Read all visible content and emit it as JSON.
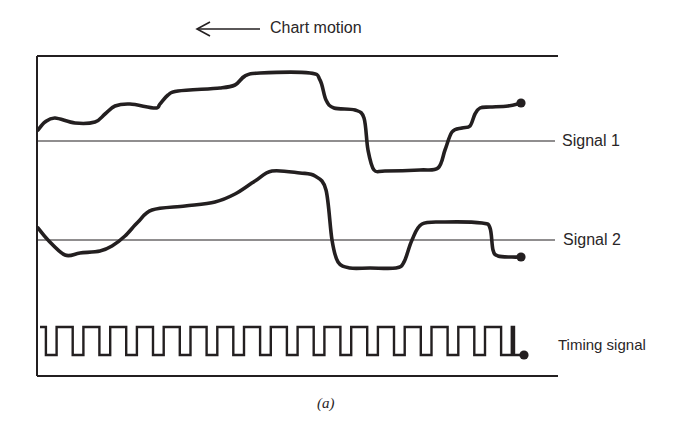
{
  "header": {
    "motion_label": "Chart motion",
    "motion_direction": "left"
  },
  "labels": {
    "signal1": "Signal 1",
    "signal2": "Signal 2",
    "timing": "Timing signal"
  },
  "caption": "(a)",
  "colors": {
    "ink": "#231f20",
    "background": "#ffffff"
  },
  "chart_data": {
    "type": "line",
    "annotation": "Chart motion (arrow pointing left)",
    "xlabel": "",
    "ylabel": "",
    "grid": false,
    "series": [
      {
        "name": "Signal 1",
        "baseline_y_px": 141,
        "points_px": [
          [
            38,
            130
          ],
          [
            45,
            122
          ],
          [
            55,
            118
          ],
          [
            75,
            123
          ],
          [
            95,
            122
          ],
          [
            105,
            114
          ],
          [
            115,
            106
          ],
          [
            130,
            104
          ],
          [
            155,
            108
          ],
          [
            160,
            104
          ],
          [
            168,
            95
          ],
          [
            178,
            91
          ],
          [
            220,
            88
          ],
          [
            235,
            85
          ],
          [
            245,
            76
          ],
          [
            260,
            73
          ],
          [
            310,
            73
          ],
          [
            320,
            80
          ],
          [
            326,
            100
          ],
          [
            334,
            108
          ],
          [
            355,
            110
          ],
          [
            364,
            118
          ],
          [
            368,
            150
          ],
          [
            374,
            170
          ],
          [
            385,
            171
          ],
          [
            420,
            170
          ],
          [
            438,
            168
          ],
          [
            445,
            150
          ],
          [
            452,
            132
          ],
          [
            462,
            128
          ],
          [
            470,
            126
          ],
          [
            475,
            114
          ],
          [
            480,
            108
          ],
          [
            490,
            107
          ],
          [
            508,
            106
          ],
          [
            521,
            103
          ]
        ]
      },
      {
        "name": "Signal 2",
        "baseline_y_px": 240,
        "points_px": [
          [
            38,
            228
          ],
          [
            48,
            240
          ],
          [
            65,
            255
          ],
          [
            80,
            253
          ],
          [
            100,
            251
          ],
          [
            112,
            246
          ],
          [
            125,
            236
          ],
          [
            138,
            222
          ],
          [
            152,
            210
          ],
          [
            185,
            206
          ],
          [
            215,
            202
          ],
          [
            235,
            194
          ],
          [
            255,
            181
          ],
          [
            272,
            171
          ],
          [
            300,
            173
          ],
          [
            315,
            176
          ],
          [
            326,
            190
          ],
          [
            332,
            240
          ],
          [
            338,
            262
          ],
          [
            350,
            268
          ],
          [
            370,
            268
          ],
          [
            396,
            268
          ],
          [
            404,
            262
          ],
          [
            412,
            240
          ],
          [
            422,
            224
          ],
          [
            445,
            222
          ],
          [
            482,
            223
          ],
          [
            490,
            228
          ],
          [
            493,
            250
          ],
          [
            498,
            256
          ],
          [
            512,
            257
          ],
          [
            521,
            257
          ]
        ]
      },
      {
        "name": "Timing signal",
        "type": "square_wave",
        "high_y_px": 327,
        "low_y_px": 355,
        "pulses": 18,
        "x_start_px": 40,
        "x_end_px": 522
      }
    ]
  }
}
